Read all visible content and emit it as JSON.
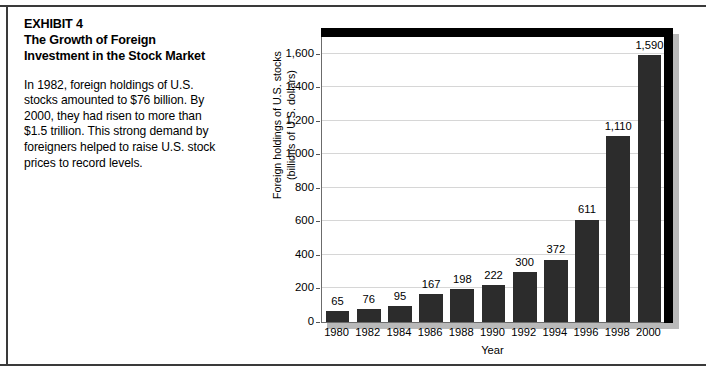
{
  "exhibit": {
    "title": "EXHIBIT 4\nThe Growth of Foreign Investment in the Stock Market",
    "body": "In 1982, foreign holdings of U.S. stocks amounted to $76 billion. By 2000, they had risen to more than $1.5 trillion. This strong demand by foreigners helped to raise U.S. stock prices to record levels."
  },
  "chart_data": {
    "type": "bar",
    "title": "",
    "xlabel": "Year",
    "ylabel": "Foreign holdings of U.S. stocks\n(billions of U.S. dollars)",
    "categories": [
      "1980",
      "1982",
      "1984",
      "1986",
      "1988",
      "1990",
      "1992",
      "1994",
      "1996",
      "1998",
      "2000"
    ],
    "values": [
      65,
      76,
      95,
      167,
      198,
      222,
      300,
      372,
      611,
      1110,
      1590
    ],
    "value_labels": [
      "65",
      "76",
      "95",
      "167",
      "198",
      "222",
      "300",
      "372",
      "611",
      "1,110",
      "1,590"
    ],
    "ylim": [
      0,
      1700
    ],
    "yticks": [
      0,
      200,
      400,
      600,
      800,
      1000,
      1200,
      1400,
      1600
    ],
    "ytick_labels": [
      "0",
      "200",
      "400",
      "600",
      "800",
      "1,000",
      "1,200",
      "1,400",
      "1,600"
    ],
    "grid": true,
    "legend": false,
    "bar_color": "#2c2c2c",
    "gridline_color": "#d6d6d6",
    "frame_color": "#000000",
    "shadow_color": "#b9b9b9"
  }
}
